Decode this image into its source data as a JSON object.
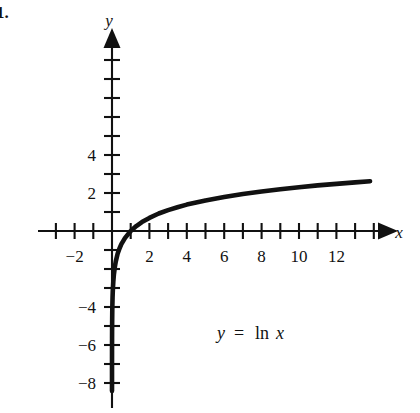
{
  "figure": {
    "problem_number": "1.",
    "equation_label": {
      "lhs": "y",
      "operator": "=",
      "function": "ln",
      "argument": "x",
      "full": "y = ln x"
    },
    "x_axis_name": "x",
    "y_axis_name": "y",
    "background_color": "#ffffff",
    "ink_color": "#111111"
  },
  "chart_data": {
    "type": "line",
    "title": "",
    "subtitle": "",
    "xlabel": "x",
    "ylabel": "y",
    "function": "y = ln x",
    "xlim": [
      -3.9,
      14.6
    ],
    "ylim": [
      -8.6,
      5.6
    ],
    "grid": false,
    "legend": null,
    "annotations": [
      {
        "text": "y = ln x",
        "x": 6.3,
        "y": -5.1
      }
    ],
    "axes": {
      "x_axis_arrow": true,
      "y_axis_arrow": true,
      "x_tick_interval": 1,
      "y_tick_interval": 1,
      "x_ticks": [
        -3,
        -2,
        -1,
        1,
        2,
        3,
        4,
        5,
        6,
        7,
        8,
        9,
        10,
        11,
        12,
        13,
        14
      ],
      "y_ticks": [
        -8,
        -7,
        -6,
        -5,
        -4,
        -3,
        -2,
        -1,
        1,
        2,
        3,
        4,
        5
      ],
      "x_tick_labels": [
        {
          "value": -2,
          "text": "−2"
        },
        {
          "value": 2,
          "text": "2"
        },
        {
          "value": 4,
          "text": "4"
        },
        {
          "value": 6,
          "text": "6"
        },
        {
          "value": 8,
          "text": "8"
        },
        {
          "value": 10,
          "text": "10"
        },
        {
          "value": 12,
          "text": "12"
        }
      ],
      "y_tick_labels": [
        {
          "value": 4,
          "text": "4"
        },
        {
          "value": 2,
          "text": "2"
        },
        {
          "value": -4,
          "text": "−4"
        },
        {
          "value": -6,
          "text": "−6"
        },
        {
          "value": -8,
          "text": "−8"
        }
      ]
    },
    "series": [
      {
        "name": "y = ln x",
        "color": "#111111",
        "line_width": 4.6,
        "x": [
          0.00022,
          0.0003,
          0.0005,
          0.0008,
          0.0012,
          0.0018,
          0.0025,
          0.0035,
          0.005,
          0.007,
          0.01,
          0.015,
          0.02,
          0.03,
          0.04,
          0.05,
          0.07,
          0.1,
          0.15,
          0.2,
          0.3,
          0.4,
          0.5,
          0.7,
          1.0,
          1.3,
          1.6,
          2.0,
          2.5,
          3.0,
          3.5,
          4.0,
          5.0,
          6.0,
          7.0,
          8.0,
          9.0,
          10.0,
          11.0,
          12.0,
          13.0,
          13.8
        ],
        "y": [
          -8.42,
          -8.11,
          -7.6,
          -7.13,
          -6.73,
          -6.32,
          -5.99,
          -5.65,
          -5.3,
          -4.96,
          -4.61,
          -4.2,
          -3.91,
          -3.51,
          -3.22,
          -3.0,
          -2.66,
          -2.3,
          -1.9,
          -1.61,
          -1.2,
          -0.92,
          -0.69,
          -0.36,
          0.0,
          0.26,
          0.47,
          0.69,
          0.92,
          1.1,
          1.25,
          1.39,
          1.61,
          1.79,
          1.95,
          2.08,
          2.2,
          2.3,
          2.4,
          2.48,
          2.56,
          2.62
        ]
      }
    ],
    "key_points": [
      {
        "label": "x-intercept",
        "x": 1,
        "y": 0
      },
      {
        "label": "vertical asymptote",
        "x": 0,
        "y": null
      }
    ]
  }
}
